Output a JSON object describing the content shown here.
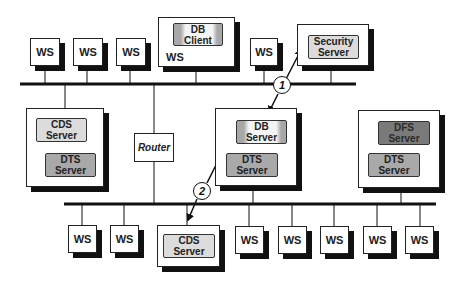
{
  "diagram": {
    "type": "network-topology",
    "colors": {
      "line": "#111111",
      "node_fill": "#ffffff",
      "shadow": "#111111",
      "service_light": "#dcdcdc",
      "service_mid": "#a9a9a9",
      "service_dark": "#7a7a7a"
    },
    "top_segment": {
      "workstations": [
        {
          "label": "WS"
        },
        {
          "label": "WS"
        },
        {
          "label": "WS"
        },
        {
          "label": "WS"
        }
      ],
      "client_host": {
        "host_label": "WS",
        "service": "DB\nClient"
      },
      "security_host": {
        "service": "Security\nServer"
      }
    },
    "router": {
      "label": "Router"
    },
    "middle_hosts": {
      "left": {
        "services": [
          "CDS\nServer",
          "DTS\nServer"
        ]
      },
      "center": {
        "services": [
          "DB\nServer",
          "DTS\nServer"
        ]
      },
      "right": {
        "services": [
          "DFS\nServer",
          "DTS\nServer"
        ]
      }
    },
    "bottom_segment": {
      "workstations": [
        {
          "label": "WS"
        },
        {
          "label": "WS"
        },
        {
          "label": "WS"
        },
        {
          "label": "WS"
        },
        {
          "label": "WS"
        },
        {
          "label": "WS"
        },
        {
          "label": "WS"
        }
      ],
      "cds_host": {
        "service": "CDS\nServer"
      }
    },
    "steps": [
      {
        "number": "1",
        "description": "DB Server to Security Server"
      },
      {
        "number": "2",
        "description": "DB Server to CDS Server"
      }
    ]
  }
}
